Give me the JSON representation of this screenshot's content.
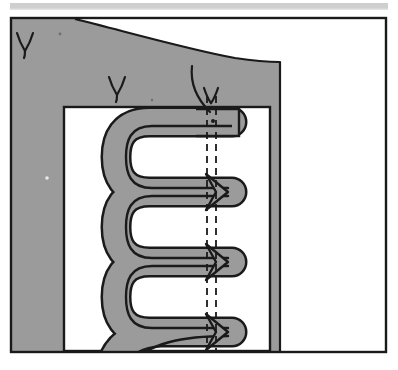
{
  "figure": {
    "title": "Serpentine meander structure diagram",
    "type": "technical-line-drawing",
    "canvas": {
      "width": 398,
      "height": 370,
      "background": "#ffffff"
    },
    "colors": {
      "background": "#ffffff",
      "shading_gray": "#9b9b9b",
      "header_bar_gray": "#cfcfcf",
      "stroke_black": "#1a1a1a",
      "paper_white": "#ffffff"
    },
    "header_bar": {
      "name": "scanned-page-header-strip",
      "x": 10,
      "y": 3,
      "width": 378,
      "height": 6,
      "color": "#cfcfcf"
    },
    "outer_frame": {
      "name": "figure-border",
      "x": 11,
      "y": 18,
      "width": 375,
      "height": 334,
      "stroke": "#1a1a1a",
      "stroke_width": 2
    },
    "gray_field": {
      "name": "matrix-shaded-region",
      "description": "Large gray field with curved upper boundary descending left-to-right, right edge vertical",
      "fill": "#9b9b9b",
      "right_edge_x": 280,
      "curve_start": {
        "x": 75,
        "y": 20
      },
      "curve_end": {
        "x": 280,
        "y": 62
      }
    },
    "inner_frame": {
      "name": "inner-window-rectangle",
      "x": 64,
      "y": 107,
      "width": 206,
      "height": 244,
      "stroke": "#1a1a1a",
      "stroke_width": 2,
      "fill": "#ffffff"
    },
    "serpentine": {
      "name": "meander-band",
      "description": "Thick gray band with black outline folding back and forth in a serpentine / meander pattern, entering at top right and exiting off the bottom edge",
      "band_fill": "#9b9b9b",
      "band_stroke": "#1a1a1a",
      "band_stroke_width": 2.4,
      "band_thickness": 26,
      "fold_count": 4,
      "left_turn_x": 128,
      "right_tip_x": 228,
      "fold_y_positions": [
        122,
        192,
        262,
        332
      ]
    },
    "dashed_lines": {
      "name": "vertical-reference-dashed-lines",
      "description": "Two closely spaced vertical dashed reference lines running down through the meander tips",
      "stroke": "#1a1a1a",
      "stroke_width": 1.6,
      "dash_pattern": "7 5",
      "x_positions": [
        207,
        216
      ],
      "y_top": 96,
      "y_bottom": 351
    },
    "arrow_notches": {
      "name": "meander-tip-arrow-notches",
      "description": "Arrowhead-shaped notches where the band tips cross the dashed reference lines",
      "count": 3,
      "y_positions": [
        190,
        258,
        328
      ]
    },
    "leader_line": {
      "name": "annotation-leader-curve",
      "description": "Curved leader line from upper field down to the top of the meander band",
      "stroke": "#1a1a1a",
      "stroke_width": 2,
      "start": {
        "x": 192,
        "y": 68
      },
      "end": {
        "x": 211,
        "y": 110
      }
    },
    "annotation_marks": [
      {
        "name": "gamma-mark-upper-left",
        "glyph": "V",
        "label": "γ",
        "x": 18,
        "y": 33,
        "size": 22
      },
      {
        "name": "gamma-mark-center",
        "glyph": "V",
        "label": "γ",
        "x": 110,
        "y": 76,
        "size": 22
      },
      {
        "name": "gamma-mark-leader",
        "glyph": "V",
        "label": "γ",
        "x": 206,
        "y": 86,
        "size": 20
      }
    ],
    "speckles": [
      {
        "name": "scan-speckle-1",
        "x": 60,
        "y": 34,
        "r": 1.4
      },
      {
        "name": "scan-speckle-2",
        "x": 47,
        "y": 178,
        "r": 1.8
      },
      {
        "name": "scan-speckle-3",
        "x": 213,
        "y": 121,
        "r": 2.0
      },
      {
        "name": "scan-speckle-4",
        "x": 152,
        "y": 100,
        "r": 1.2
      }
    ]
  },
  "chart_data": {
    "type": "line",
    "title": "Serpentine meander structure diagram",
    "xlabel": "",
    "ylabel": "",
    "series": [
      {
        "name": "meander-band-centerline",
        "description": "Folded band path, x in px, y in px",
        "x": [
          228,
          150,
          128,
          150,
          228,
          228,
          150,
          128,
          150,
          228,
          228,
          150,
          128,
          150,
          228,
          228,
          160,
          128
        ],
        "y": [
          122,
          122,
          157,
          192,
          192,
          192,
          192,
          227,
          262,
          262,
          262,
          262,
          297,
          332,
          332,
          332,
          345,
          360
        ]
      }
    ],
    "annotations": [
      "γ",
      "γ",
      "γ"
    ],
    "grid": false,
    "legend": "none"
  }
}
